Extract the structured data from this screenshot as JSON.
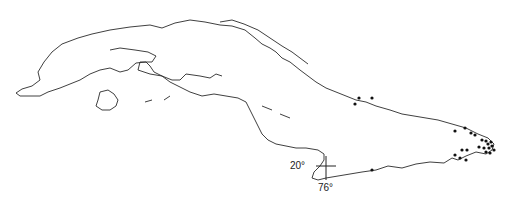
{
  "map": {
    "subject": "Cuba outline with distribution point records",
    "graticule": {
      "latitude_label": "20°",
      "longitude_label": "76°"
    },
    "colors": {
      "coastline": "#2a2a2a",
      "points": "#111111",
      "background": "#ffffff"
    },
    "points": [
      [
        355,
        104
      ],
      [
        359,
        98
      ],
      [
        372,
        98
      ],
      [
        455,
        131
      ],
      [
        465,
        128
      ],
      [
        471,
        133
      ],
      [
        475,
        135
      ],
      [
        482,
        140
      ],
      [
        486,
        141
      ],
      [
        488,
        144
      ],
      [
        491,
        142
      ],
      [
        479,
        147
      ],
      [
        484,
        148
      ],
      [
        489,
        148
      ],
      [
        492,
        146
      ],
      [
        494,
        150
      ],
      [
        486,
        152
      ],
      [
        490,
        153
      ],
      [
        462,
        150
      ],
      [
        467,
        150
      ],
      [
        455,
        155
      ],
      [
        460,
        158
      ],
      [
        466,
        160
      ],
      [
        372,
        170
      ]
    ]
  }
}
